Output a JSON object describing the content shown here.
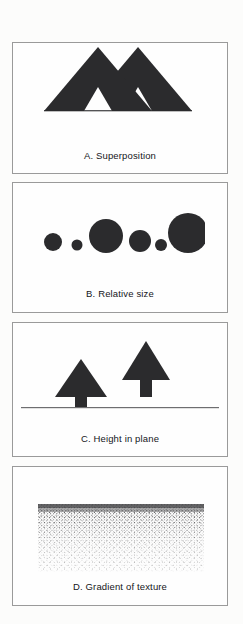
{
  "document": {
    "type": "figure-plate",
    "background_color": "#fcfcfb",
    "panel_border_color": "#9a9a9a",
    "ink_color": "#262628",
    "text_color": "#15161a"
  },
  "panels": [
    {
      "id": "a",
      "caption": "A. Superposition",
      "figure_name": "two-overlapping-triangles",
      "description_elements": {
        "shape": "triangle",
        "count": 2,
        "fill": "#2b2b2d"
      }
    },
    {
      "id": "b",
      "caption": "B. Relative size",
      "figure_name": "row-of-circles-varying-size",
      "description_elements": {
        "shape": "circle",
        "count": 6,
        "fill": "#2b2b2d",
        "radii": [
          9,
          5.5,
          17,
          11,
          6,
          20
        ]
      }
    },
    {
      "id": "c",
      "caption": "C. Height in plane",
      "figure_name": "two-trees-on-horizon-line",
      "description_elements": {
        "shape": "tree",
        "count": 2,
        "fill": "#2b2b2d",
        "horizon_line": true
      }
    },
    {
      "id": "d",
      "caption": "D. Gradient of texture",
      "figure_name": "stippled-texture-gradient",
      "description_elements": {
        "shape": "dot-stipple-field",
        "fill": "#3a3a3c",
        "gradient": "dense at top, sparse at bottom"
      }
    }
  ]
}
